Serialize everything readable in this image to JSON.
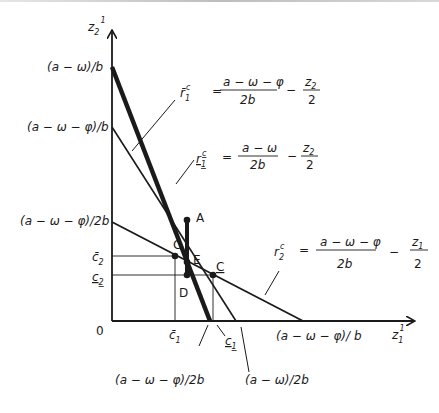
{
  "diagram": {
    "axes": {
      "y_label": "z",
      "y_label_sub": "2",
      "y_label_sup": "1",
      "x_label": "z",
      "x_label_sub": "1",
      "x_label_sup": "1",
      "origin_label": "0"
    },
    "y_ticks": {
      "top": "(a − ω)/b",
      "mid": "(a − ω − φ)/b",
      "low": "(a − ω − φ)/2b",
      "c2_bar": "c̄",
      "c2_bar_sub": "2",
      "c2_under": "c",
      "c2_under_sub": "2"
    },
    "x_ticks": {
      "c1_bar": "c̄",
      "c1_bar_sub": "1",
      "c1_under": "c",
      "c1_under_sub": "1",
      "half_phi": "(a − ω − φ)/2b",
      "half": "(a − ω)/2b",
      "full_phi": "(a − ω − φ)/ b"
    },
    "points": {
      "A": "A",
      "C_bar": "C̄",
      "E": "E",
      "D": "D",
      "C_under": "C"
    },
    "equations": {
      "r1_bar": {
        "lhs": "r̄",
        "lhs_sub": "1",
        "lhs_sup": "c",
        "eq": "=",
        "num": "a − ω − φ",
        "den": "2b",
        "minus": "−",
        "tnum": "z",
        "tnum_sub": "2",
        "tden": "2"
      },
      "r1_under": {
        "lhs": "r",
        "lhs_sub": "1",
        "lhs_sup": "c",
        "eq": "=",
        "num": "a − ω",
        "den": "2b",
        "minus": "−",
        "tnum": "z",
        "tnum_sub": "2",
        "tden": "2"
      },
      "r2": {
        "lhs": "r",
        "lhs_sub": "2",
        "lhs_sup": "c",
        "eq": "=",
        "num": "a − ω − φ",
        "den": "2b",
        "minus": "−",
        "tnum": "z",
        "tnum_sub": "1",
        "tden": "2"
      }
    }
  }
}
